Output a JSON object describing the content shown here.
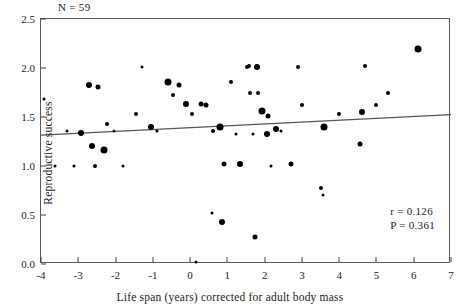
{
  "chart_data": {
    "type": "scatter",
    "title": "",
    "xlabel": "Life span (years) corrected for adult body mass",
    "ylabel": "Reproductive success",
    "xlim": [
      -4,
      7
    ],
    "ylim": [
      0.0,
      2.5
    ],
    "xticks": [
      "-4",
      "-3",
      "-2",
      "-1",
      "0",
      "1",
      "2",
      "3",
      "4",
      "5",
      "6",
      "7"
    ],
    "xtick_values": [
      -4,
      -3,
      -2,
      -1,
      0,
      1,
      2,
      3,
      4,
      5,
      6,
      7
    ],
    "yticks": [
      "0.0",
      "0.5",
      "1.0",
      "1.5",
      "2.0",
      "2.5"
    ],
    "ytick_values": [
      0.0,
      0.5,
      1.0,
      1.5,
      2.0,
      2.5
    ],
    "grid": false,
    "legend": null,
    "annotations": [
      {
        "name": "sample-size",
        "text": "N = 59",
        "x": -3.4,
        "y": 2.58
      },
      {
        "name": "correlation",
        "text": "r = 0.126",
        "x": 5.4,
        "y": 0.42
      },
      {
        "name": "p-value",
        "text": "P = 0.361",
        "x": 5.4,
        "y": 0.33
      }
    ],
    "fit_line": {
      "name": "regression-line",
      "x0": -4,
      "y0": 1.315,
      "x1": 7,
      "y1": 1.525,
      "color": "#555555"
    },
    "marker_color": "#000000",
    "points": [
      {
        "x": -3.92,
        "y": 1.68,
        "size": 3
      },
      {
        "x": -3.62,
        "y": 1.0,
        "size": 3
      },
      {
        "x": -3.3,
        "y": 1.36,
        "size": 3
      },
      {
        "x": -3.12,
        "y": 1.0,
        "size": 3
      },
      {
        "x": -2.92,
        "y": 1.34,
        "size": 6
      },
      {
        "x": -2.72,
        "y": 1.83,
        "size": 6
      },
      {
        "x": -2.62,
        "y": 1.2,
        "size": 6
      },
      {
        "x": -2.55,
        "y": 1.0,
        "size": 4
      },
      {
        "x": -2.46,
        "y": 1.81,
        "size": 5
      },
      {
        "x": -2.3,
        "y": 1.16,
        "size": 7
      },
      {
        "x": -2.22,
        "y": 1.43,
        "size": 4
      },
      {
        "x": -2.05,
        "y": 1.36,
        "size": 3
      },
      {
        "x": -1.8,
        "y": 1.0,
        "size": 3
      },
      {
        "x": -1.46,
        "y": 1.53,
        "size": 4
      },
      {
        "x": -1.3,
        "y": 2.01,
        "size": 3
      },
      {
        "x": -1.05,
        "y": 1.4,
        "size": 6
      },
      {
        "x": -0.88,
        "y": 1.36,
        "size": 3
      },
      {
        "x": -0.6,
        "y": 1.86,
        "size": 7
      },
      {
        "x": -0.45,
        "y": 1.72,
        "size": 4
      },
      {
        "x": -0.3,
        "y": 1.83,
        "size": 5
      },
      {
        "x": -0.12,
        "y": 1.63,
        "size": 6
      },
      {
        "x": 0.05,
        "y": 1.53,
        "size": 4
      },
      {
        "x": 0.15,
        "y": 0.02,
        "size": 3
      },
      {
        "x": 0.3,
        "y": 1.63,
        "size": 5
      },
      {
        "x": 0.42,
        "y": 1.62,
        "size": 5
      },
      {
        "x": 0.58,
        "y": 0.52,
        "size": 3
      },
      {
        "x": 0.62,
        "y": 1.36,
        "size": 4
      },
      {
        "x": 0.8,
        "y": 1.4,
        "size": 7
      },
      {
        "x": 0.86,
        "y": 0.43,
        "size": 6
      },
      {
        "x": 0.92,
        "y": 1.02,
        "size": 5
      },
      {
        "x": 1.1,
        "y": 1.86,
        "size": 4
      },
      {
        "x": 1.22,
        "y": 1.33,
        "size": 3
      },
      {
        "x": 1.35,
        "y": 1.02,
        "size": 6
      },
      {
        "x": 1.52,
        "y": 2.01,
        "size": 4
      },
      {
        "x": 1.58,
        "y": 2.02,
        "size": 4
      },
      {
        "x": 1.62,
        "y": 1.74,
        "size": 4
      },
      {
        "x": 1.7,
        "y": 1.33,
        "size": 3
      },
      {
        "x": 1.75,
        "y": 0.28,
        "size": 5
      },
      {
        "x": 1.8,
        "y": 2.01,
        "size": 6
      },
      {
        "x": 1.82,
        "y": 1.75,
        "size": 4
      },
      {
        "x": 1.92,
        "y": 1.56,
        "size": 7
      },
      {
        "x": 2.05,
        "y": 1.33,
        "size": 6
      },
      {
        "x": 2.1,
        "y": 1.51,
        "size": 5
      },
      {
        "x": 2.18,
        "y": 1.0,
        "size": 3
      },
      {
        "x": 2.3,
        "y": 1.38,
        "size": 6
      },
      {
        "x": 2.45,
        "y": 1.36,
        "size": 3
      },
      {
        "x": 2.7,
        "y": 1.02,
        "size": 5
      },
      {
        "x": 2.9,
        "y": 2.01,
        "size": 4
      },
      {
        "x": 3.0,
        "y": 1.62,
        "size": 4
      },
      {
        "x": 3.52,
        "y": 0.78,
        "size": 4
      },
      {
        "x": 3.56,
        "y": 0.7,
        "size": 3
      },
      {
        "x": 3.6,
        "y": 1.4,
        "size": 7
      },
      {
        "x": 4.0,
        "y": 1.53,
        "size": 4
      },
      {
        "x": 4.55,
        "y": 1.22,
        "size": 5
      },
      {
        "x": 4.62,
        "y": 1.55,
        "size": 6
      },
      {
        "x": 4.7,
        "y": 2.02,
        "size": 4
      },
      {
        "x": 5.0,
        "y": 1.62,
        "size": 4
      },
      {
        "x": 5.3,
        "y": 1.75,
        "size": 4
      },
      {
        "x": 6.12,
        "y": 2.19,
        "size": 7
      }
    ]
  }
}
